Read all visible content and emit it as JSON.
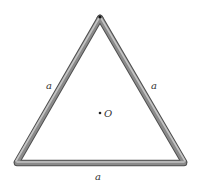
{
  "diagram": {
    "type": "equilateral-triangle-rod-frame",
    "vertices": {
      "top": [
        100,
        17
      ],
      "bottom_left": [
        17,
        163
      ],
      "bottom_right": [
        185,
        163
      ]
    },
    "rod": {
      "width": 6,
      "color_dark": "#5a5a5a",
      "color_mid": "#8c8c8c",
      "color_light": "#c8c8c8"
    },
    "sides": [
      {
        "id": "left",
        "label": "a",
        "label_pos": [
          49,
          88
        ]
      },
      {
        "id": "right",
        "label": "a",
        "label_pos": [
          154,
          88
        ]
      },
      {
        "id": "bottom",
        "label": "a",
        "label_pos": [
          98,
          179
        ]
      }
    ],
    "center_point": {
      "label": "O",
      "dot_pos": [
        100,
        113
      ],
      "label_pos": [
        105,
        117
      ]
    },
    "pivot": {
      "pos": [
        100,
        18
      ]
    }
  }
}
